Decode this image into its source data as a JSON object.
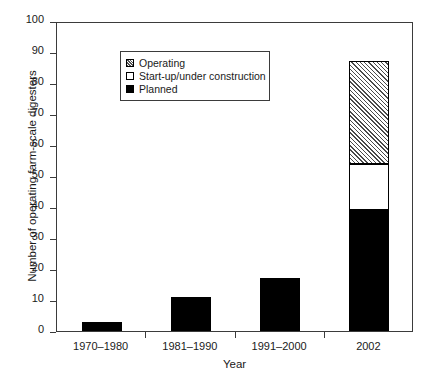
{
  "chart_data": {
    "type": "bar",
    "subtype": "stacked-bar",
    "title": "",
    "xlabel": "Year",
    "ylabel": "Number of operating farm-scale digesters",
    "categories": [
      "1970–1980",
      "1981–1990",
      "1991–2000",
      "2002"
    ],
    "series": [
      {
        "name": "Planned",
        "values": [
          3,
          11,
          17,
          39
        ],
        "fill": "solid-black",
        "color": "#000000"
      },
      {
        "name": "Start-up/under construction",
        "values": [
          0,
          0,
          0,
          15
        ],
        "fill": "white",
        "color": "#ffffff"
      },
      {
        "name": "Operating",
        "values": [
          0,
          0,
          0,
          33
        ],
        "fill": "hatched",
        "color": "#4a4a4a"
      }
    ],
    "stack_order_bottom_to_top": [
      "Planned",
      "Start-up/under construction",
      "Operating"
    ],
    "totals": [
      3,
      11,
      17,
      87
    ],
    "ylim": [
      0,
      100
    ],
    "yticks": [
      0,
      10,
      20,
      30,
      40,
      50,
      60,
      70,
      80,
      90,
      100
    ],
    "ytick_labels": [
      "0",
      "10",
      "20",
      "30",
      "40",
      "50",
      "60",
      "70",
      "80",
      "90",
      "100"
    ],
    "grid": false,
    "legend_position": "upper-left-inside",
    "legend_entries": [
      "Operating",
      "Start-up/under construction",
      "Planned"
    ]
  },
  "axes": {
    "y_title": "Number of operating farm-scale digesters",
    "x_title": "Year"
  },
  "legend": {
    "items": [
      {
        "label": "Operating",
        "swatch": "hatched-square-icon"
      },
      {
        "label": "Start-up/under construction",
        "swatch": "white-square-icon"
      },
      {
        "label": "Planned",
        "swatch": "black-square-icon"
      }
    ]
  }
}
